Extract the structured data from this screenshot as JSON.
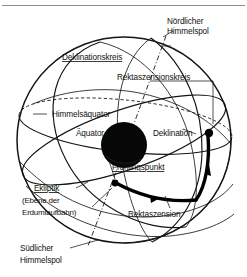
{
  "figure": {
    "type": "astronomy-celestial-sphere-diagram",
    "colors": {
      "line": "#141414",
      "earth": "#070707",
      "accent": "#000000",
      "rule": "#8e8e8e",
      "background": "#ffffff"
    },
    "labels": {
      "north_pole": {
        "line1": "Nördlicher",
        "line2": "Himmelspol"
      },
      "declination_circle": "Deklinationskreis",
      "right_ascension_circle": "Rektaszensionskreis",
      "celestial_equator": "Himmelsäquator",
      "equator": "Äquator",
      "declination": "Deklination",
      "vernal_equinox": "Frühlingspunkt",
      "ecliptic": {
        "line1": "Ekliptik",
        "line2": "(Ebene der",
        "line3": "Erdumlaufbahn)"
      },
      "right_ascension": "Rektaszension",
      "south_pole": {
        "line1": "Südlicher",
        "line2": "Himmelspol"
      }
    },
    "elements": {
      "sphere": "celestial-sphere",
      "earth": "earth-disk",
      "vernal_point_marker": "vernal-equinox-point",
      "star_marker": "star-point"
    }
  }
}
